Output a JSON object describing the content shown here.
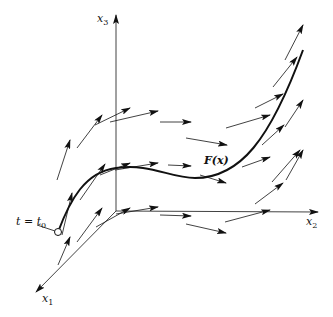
{
  "diagram": {
    "colors": {
      "stroke": "#111111",
      "background": "#ffffff"
    },
    "axes": {
      "origin": [
        116,
        211
      ],
      "x1": {
        "label": "x",
        "sub": "1",
        "end": [
          36,
          292
        ]
      },
      "x2": {
        "label": "x",
        "sub": "2",
        "end": [
          318,
          212
        ]
      },
      "x3": {
        "label": "x",
        "sub": "3",
        "end": [
          116,
          15
        ]
      }
    },
    "curve": {
      "label": "F(x)",
      "path": "M58,232 C70,200 85,172 116,168 C150,163 170,178 195,178 C240,178 270,140 303,50"
    },
    "start_point": {
      "label_t": "t",
      "label_eq": " = ",
      "label_t0": "t",
      "label_t0_sub": "0",
      "center": [
        58,
        232
      ]
    },
    "vectors": [
      [
        57,
        180,
        70,
        140
      ],
      [
        77,
        148,
        102,
        115
      ],
      [
        95,
        125,
        130,
        108
      ],
      [
        110,
        122,
        158,
        111
      ],
      [
        160,
        122,
        191,
        122
      ],
      [
        186,
        138,
        227,
        145
      ],
      [
        226,
        128,
        270,
        115
      ],
      [
        255,
        108,
        283,
        94
      ],
      [
        273,
        87,
        297,
        57
      ],
      [
        285,
        60,
        303,
        25
      ],
      [
        62,
        235,
        72,
        193
      ],
      [
        80,
        200,
        105,
        164
      ],
      [
        100,
        175,
        130,
        163
      ],
      [
        115,
        170,
        158,
        163
      ],
      [
        168,
        165,
        191,
        166
      ],
      [
        200,
        175,
        226,
        183
      ],
      [
        242,
        167,
        270,
        157
      ],
      [
        262,
        145,
        284,
        125
      ],
      [
        285,
        127,
        303,
        100
      ],
      [
        286,
        180,
        303,
        150
      ],
      [
        58,
        265,
        70,
        237
      ],
      [
        77,
        242,
        102,
        208
      ],
      [
        96,
        227,
        130,
        208
      ],
      [
        116,
        214,
        158,
        207
      ],
      [
        160,
        215,
        191,
        216
      ],
      [
        186,
        224,
        226,
        233
      ],
      [
        225,
        222,
        270,
        210
      ],
      [
        255,
        204,
        283,
        183
      ],
      [
        272,
        182,
        300,
        150
      ]
    ]
  }
}
